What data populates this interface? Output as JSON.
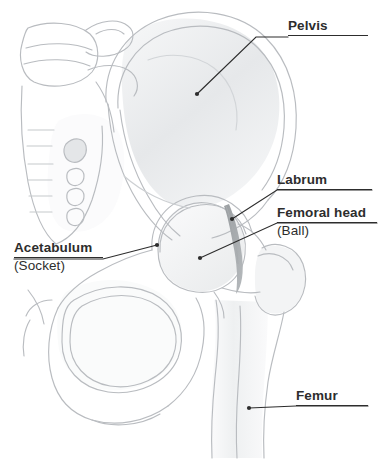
{
  "figure": {
    "background_color": "#ffffff",
    "label_color": "#2d2d2d",
    "line_color": "#2d2d2d",
    "bone_outline_color": "#b9bcc0",
    "bone_shade_color": "#e8eaec",
    "labrum_color": "#8e9295"
  },
  "callouts": [
    {
      "id": "pelvis",
      "label": "Pelvis",
      "sublabel": "",
      "underline": true,
      "label_x": 288,
      "label_y": 18,
      "leader": {
        "from_x": 288,
        "from_y": 37,
        "bend_x": 256,
        "bend_y": 37,
        "to_x": 197,
        "to_y": 94
      },
      "dot_x": 197,
      "dot_y": 94
    },
    {
      "id": "labrum",
      "label": "Labrum",
      "sublabel": "",
      "underline": true,
      "label_x": 277,
      "label_y": 172,
      "leader": {
        "from_x": 372,
        "from_y": 190,
        "bend_x": 277,
        "bend_y": 190,
        "to_x": 232,
        "to_y": 219
      },
      "dot_x": 232,
      "dot_y": 219
    },
    {
      "id": "femoral-head",
      "label": "Femoral head",
      "sublabel": "(Ball)",
      "underline": true,
      "label_x": 277,
      "label_y": 205,
      "leader": {
        "from_x": 377,
        "from_y": 223,
        "bend_x": 277,
        "bend_y": 223,
        "to_x": 200,
        "to_y": 258
      },
      "dot_x": 200,
      "dot_y": 258
    },
    {
      "id": "acetabulum",
      "label": "Acetabulum",
      "sublabel": "(Socket)",
      "underline": true,
      "label_x": 14,
      "label_y": 240,
      "leader": {
        "from_x": 14,
        "from_y": 259,
        "bend_x": 103,
        "bend_y": 259,
        "to_x": 157,
        "to_y": 245
      },
      "dot_x": 157,
      "dot_y": 245
    },
    {
      "id": "femur",
      "label": "Femur",
      "sublabel": "",
      "underline": true,
      "label_x": 296,
      "label_y": 388,
      "leader": {
        "from_x": 368,
        "from_y": 406,
        "bend_x": 296,
        "bend_y": 406,
        "to_x": 249,
        "to_y": 408
      },
      "dot_x": 249,
      "dot_y": 408
    }
  ],
  "structures": [
    {
      "name": "sacrum",
      "description": "vertebral column and sacrum with horizontal segment lines and sacral foramina, upper left"
    },
    {
      "name": "ilium",
      "description": "large fan-shaped iliac wing forming the upper pelvis"
    },
    {
      "name": "acetabulum-socket",
      "description": "cup-shaped socket of the pelvis receiving the femoral head"
    },
    {
      "name": "labrum",
      "description": "thin dark crescent of cartilage at the rim of the acetabulum"
    },
    {
      "name": "femoral-head",
      "description": "rounded ball at the top of the femur"
    },
    {
      "name": "femoral-neck",
      "description": "narrow bone segment joining head to shaft"
    },
    {
      "name": "greater-trochanter",
      "description": "bony prominence lateral to the femoral neck"
    },
    {
      "name": "lesser-trochanter",
      "description": "small medial bony prominence below the femoral neck"
    },
    {
      "name": "obturator-foramen",
      "description": "large rounded opening in the lower pelvis"
    },
    {
      "name": "pubis-ischium",
      "description": "lower pelvic rami bounding the obturator foramen"
    },
    {
      "name": "femur-shaft",
      "description": "long bone shaft descending to the bottom of the figure"
    }
  ]
}
